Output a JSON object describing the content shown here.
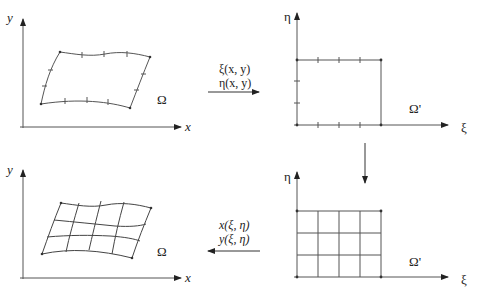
{
  "diagram": {
    "type": "grid-mapping",
    "panels": {
      "physical_boundary": {
        "x_axis": "x",
        "y_axis": "y",
        "region": "Ω"
      },
      "computational_boundary": {
        "x_axis": "ξ",
        "y_axis": "η",
        "region": "Ω'"
      },
      "computational_grid": {
        "x_axis": "ξ",
        "y_axis": "η",
        "region": "Ω'"
      },
      "physical_grid": {
        "x_axis": "x",
        "y_axis": "y",
        "region": "Ω"
      }
    },
    "forward_map": {
      "line1": "ξ(x, y)",
      "line2": "η(x, y)"
    },
    "inverse_map": {
      "line1": "x(ξ, η)",
      "line2": "y(ξ, η)"
    }
  },
  "colors": {
    "line": "#444444",
    "text": "#222222",
    "background": "#ffffff"
  }
}
